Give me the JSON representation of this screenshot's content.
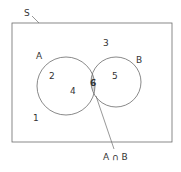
{
  "diagram": {
    "type": "venn",
    "universe_label": "S",
    "sets": [
      {
        "name": "A",
        "label": "A"
      },
      {
        "name": "B",
        "label": "B"
      }
    ],
    "regions": {
      "outside": "1",
      "a_only_1": "2",
      "a_only_2": "4",
      "outside_top": "3",
      "b_only": "5",
      "intersection": "6"
    },
    "intersection_label": "A ∩ B",
    "colors": {
      "stroke": "#6b6b6b",
      "intersection_fill": "#d9d9d9",
      "text": "#333333"
    }
  }
}
